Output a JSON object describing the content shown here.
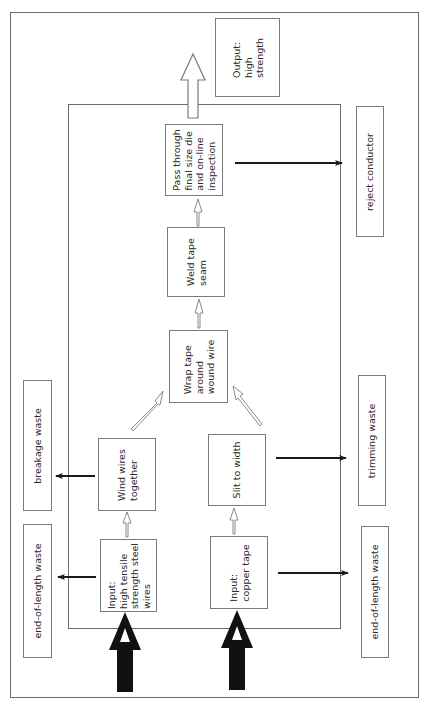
{
  "diagram": {
    "orientation": "rotated 90° counter-clockwise; flow bottom-to-top",
    "outputs": [
      {
        "id": "output",
        "label": "Output:\nhigh\nstrength"
      }
    ],
    "process_steps": [
      {
        "id": "input_steel",
        "label": "Input:\nhigh tensile\nstrength steel\nwires"
      },
      {
        "id": "wind",
        "label": "Wind wires\ntogether"
      },
      {
        "id": "input_copper",
        "label": "Input:\ncopper tape"
      },
      {
        "id": "slit",
        "label": "Slit to width"
      },
      {
        "id": "wrap",
        "label": "Wrap tape\naround\nwound wire"
      },
      {
        "id": "weld",
        "label": "Weld tape\nseam"
      },
      {
        "id": "pass",
        "label": "Pass through\nfinal size die\nand on-line\ninspection"
      }
    ],
    "wastes": [
      {
        "id": "waste_eol_left",
        "label": "end-of-length waste"
      },
      {
        "id": "waste_breakage",
        "label": "breakage waste"
      },
      {
        "id": "waste_reject",
        "label": "reject conductor"
      },
      {
        "id": "waste_trimming",
        "label": "trimming waste"
      },
      {
        "id": "waste_eol_right",
        "label": "end-of-length waste"
      }
    ],
    "flows": [
      {
        "from": "external",
        "to": "input_steel",
        "style": "thick-black-input"
      },
      {
        "from": "external",
        "to": "input_copper",
        "style": "thick-black-input"
      },
      {
        "from": "input_steel",
        "to": "wind",
        "style": "hollow"
      },
      {
        "from": "input_copper",
        "to": "slit",
        "style": "hollow"
      },
      {
        "from": "wind",
        "to": "wrap",
        "style": "hollow"
      },
      {
        "from": "slit",
        "to": "wrap",
        "style": "hollow"
      },
      {
        "from": "wrap",
        "to": "weld",
        "style": "hollow"
      },
      {
        "from": "weld",
        "to": "pass",
        "style": "hollow"
      },
      {
        "from": "pass",
        "to": "output",
        "style": "large-hollow-output"
      },
      {
        "from": "input_steel",
        "to": "waste_eol_left",
        "style": "black-line"
      },
      {
        "from": "wind",
        "to": "waste_breakage",
        "style": "black-line"
      },
      {
        "from": "pass",
        "to": "waste_reject",
        "style": "black-line"
      },
      {
        "from": "slit",
        "to": "waste_trimming",
        "style": "black-line"
      },
      {
        "from": "input_copper",
        "to": "waste_eol_right",
        "style": "black-line"
      }
    ]
  }
}
